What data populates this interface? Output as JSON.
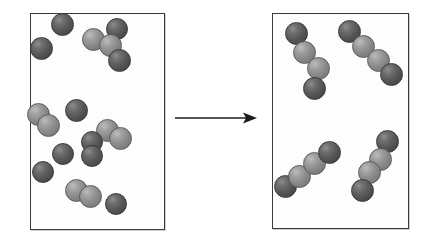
{
  "figure": {
    "type": "reaction-schematic",
    "background_color": "#ffffff",
    "sphere_colors": {
      "dark": "#5a5a5a",
      "light": "#8d8d8d"
    },
    "box_border_color": "#3a3a3a",
    "arrow": {
      "name": "reaction-arrow",
      "direction": "right",
      "color": "#1c1c1c",
      "x": 175,
      "y": 118,
      "length": 82
    },
    "panels": [
      {
        "name": "reactants-box",
        "label": "",
        "x": 30,
        "y": 13,
        "width": 135,
        "height": 217,
        "sphere_count": 18,
        "spheres": [
          {
            "x": 62,
            "y": 24,
            "r": 11.5,
            "shade": "dark"
          },
          {
            "x": 117,
            "y": 29,
            "r": 11.0,
            "shade": "dark"
          },
          {
            "x": 93,
            "y": 39,
            "r": 11.5,
            "shade": "light"
          },
          {
            "x": 110,
            "y": 45,
            "r": 11.5,
            "shade": "light"
          },
          {
            "x": 41,
            "y": 48,
            "r": 11.5,
            "shade": "dark"
          },
          {
            "x": 119,
            "y": 60,
            "r": 11.5,
            "shade": "dark"
          },
          {
            "x": 38,
            "y": 114,
            "r": 11.5,
            "shade": "light"
          },
          {
            "x": 48,
            "y": 125,
            "r": 11.5,
            "shade": "light"
          },
          {
            "x": 76,
            "y": 110,
            "r": 11.5,
            "shade": "dark"
          },
          {
            "x": 107,
            "y": 130,
            "r": 11.5,
            "shade": "light"
          },
          {
            "x": 120,
            "y": 138,
            "r": 11.5,
            "shade": "light"
          },
          {
            "x": 92,
            "y": 142,
            "r": 11.0,
            "shade": "dark"
          },
          {
            "x": 43,
            "y": 172,
            "r": 11.0,
            "shade": "dark"
          },
          {
            "x": 76,
            "y": 190,
            "r": 11.5,
            "shade": "light"
          },
          {
            "x": 90,
            "y": 196,
            "r": 11.5,
            "shade": "light"
          },
          {
            "x": 116,
            "y": 204,
            "r": 11.0,
            "shade": "dark"
          },
          {
            "x": 63,
            "y": 154,
            "r": 11.0,
            "shade": "dark"
          },
          {
            "x": 92,
            "y": 156,
            "r": 11.0,
            "shade": "dark"
          }
        ]
      },
      {
        "name": "products-box",
        "label": "",
        "x": 272,
        "y": 13,
        "width": 137,
        "height": 216,
        "chain_count": 4,
        "chain_length": 4,
        "chains": [
          {
            "name": "chain-top-left",
            "spheres": [
              {
                "x": 296,
                "y": 33,
                "r": 11.5,
                "shade": "dark"
              },
              {
                "x": 304,
                "y": 52,
                "r": 11.5,
                "shade": "light"
              },
              {
                "x": 318,
                "y": 68,
                "r": 11.5,
                "shade": "light"
              },
              {
                "x": 314,
                "y": 88,
                "r": 11.5,
                "shade": "dark"
              }
            ]
          },
          {
            "name": "chain-top-right",
            "spheres": [
              {
                "x": 349,
                "y": 31,
                "r": 11.5,
                "shade": "dark"
              },
              {
                "x": 363,
                "y": 46,
                "r": 11.5,
                "shade": "light"
              },
              {
                "x": 378,
                "y": 60,
                "r": 11.5,
                "shade": "light"
              },
              {
                "x": 391,
                "y": 74,
                "r": 11.5,
                "shade": "dark"
              }
            ]
          },
          {
            "name": "chain-bottom-left",
            "spheres": [
              {
                "x": 285,
                "y": 186,
                "r": 11.5,
                "shade": "dark"
              },
              {
                "x": 299,
                "y": 176,
                "r": 11.5,
                "shade": "light"
              },
              {
                "x": 314,
                "y": 163,
                "r": 11.5,
                "shade": "light"
              },
              {
                "x": 329,
                "y": 152,
                "r": 11.5,
                "shade": "dark"
              }
            ]
          },
          {
            "name": "chain-bottom-right",
            "spheres": [
              {
                "x": 387,
                "y": 141,
                "r": 11.5,
                "shade": "dark"
              },
              {
                "x": 380,
                "y": 159,
                "r": 11.5,
                "shade": "light"
              },
              {
                "x": 369,
                "y": 172,
                "r": 11.5,
                "shade": "light"
              },
              {
                "x": 362,
                "y": 190,
                "r": 11.5,
                "shade": "dark"
              }
            ]
          }
        ]
      }
    ]
  }
}
